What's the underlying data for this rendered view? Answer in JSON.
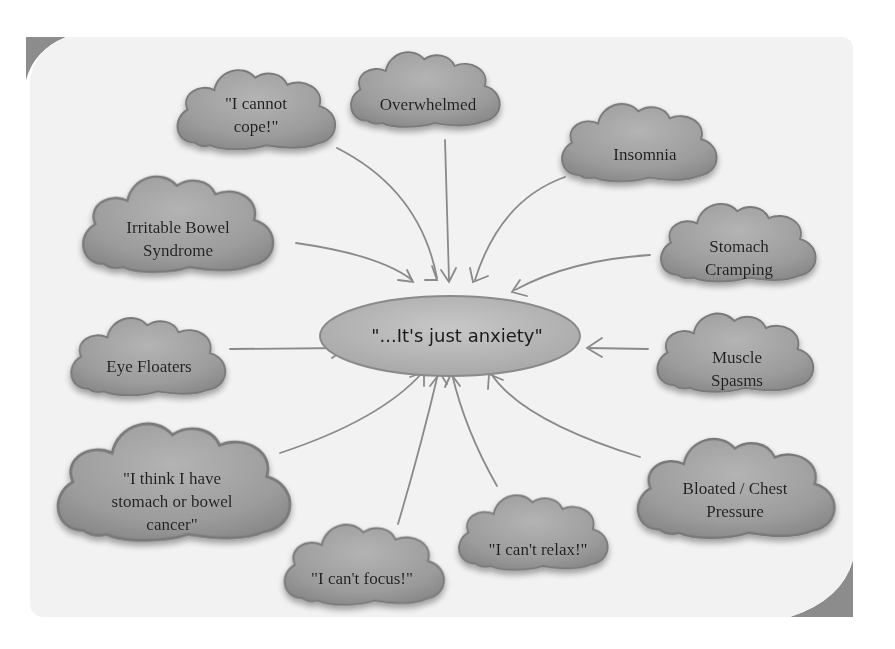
{
  "diagram": {
    "center": {
      "label": "\"...It's just anxiety\""
    },
    "nodes": [
      {
        "id": "cannot-cope",
        "lines": [
          "\"I cannot",
          "cope!\""
        ]
      },
      {
        "id": "overwhelmed",
        "lines": [
          "Overwhelmed"
        ]
      },
      {
        "id": "insomnia",
        "lines": [
          "Insomnia"
        ]
      },
      {
        "id": "irritable-bowel-syndrome",
        "lines": [
          "Irritable Bowel",
          "Syndrome"
        ]
      },
      {
        "id": "stomach-cramping",
        "lines": [
          "Stomach",
          "Cramping"
        ]
      },
      {
        "id": "eye-floaters",
        "lines": [
          "Eye Floaters"
        ]
      },
      {
        "id": "muscle-spasms",
        "lines": [
          "Muscle",
          "Spasms"
        ]
      },
      {
        "id": "stomach-bowel-cancer",
        "lines": [
          "\"I think I have",
          "stomach or bowel",
          "cancer\""
        ]
      },
      {
        "id": "bloated-chest-pressure",
        "lines": [
          "Bloated / Chest",
          "Pressure"
        ]
      },
      {
        "id": "cant-focus",
        "lines": [
          "\"I can't focus!\""
        ]
      },
      {
        "id": "cant-relax",
        "lines": [
          "\"I can't relax!\""
        ]
      }
    ],
    "colors": {
      "background": "#f3f3f3",
      "cloud_fill": "#9a9a9a",
      "cloud_stroke": "#7a7a7a",
      "arrow": "#8a8a8a",
      "corner_accent": "#8c8c8c",
      "text": "#1e1e1e"
    }
  }
}
